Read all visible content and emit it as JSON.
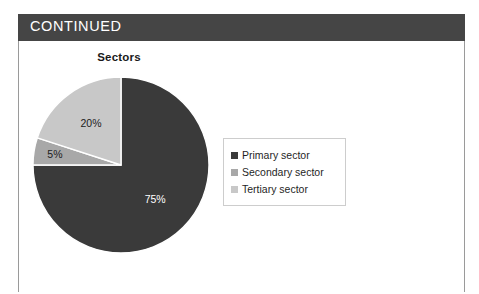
{
  "banner": {
    "label": "CONTINUED",
    "background_color": "#454545",
    "text_color": "#ffffff"
  },
  "page": {
    "background_color": "#ffffff",
    "frame_color": "#9a9a9a"
  },
  "legend": {
    "position": "right",
    "border_color": "#cdcdcd",
    "entries": [
      {
        "label": "Primary sector",
        "color": "#3a3a3a"
      },
      {
        "label": "Secondary sector",
        "color": "#a8a8a8"
      },
      {
        "label": "Tertiary sector",
        "color": "#c8c8c8"
      }
    ]
  },
  "chart_data": {
    "type": "pie",
    "title": "Sectors",
    "xlabel": "",
    "ylabel": "",
    "grid": false,
    "legend_position": "right",
    "start_angle_deg": 0,
    "direction": "clockwise",
    "categories": [
      "Primary sector",
      "Secondary sector",
      "Tertiary sector"
    ],
    "values": [
      75,
      5,
      20
    ],
    "unit": "%",
    "data_labels": [
      "75%",
      "5%",
      "20%"
    ],
    "colors": [
      "#3a3a3a",
      "#a8a8a8",
      "#c8c8c8"
    ],
    "slices": [
      {
        "name": "Primary sector",
        "value": 75,
        "label": "75%",
        "color": "#3a3a3a",
        "label_color": "#ffffff",
        "start_deg": 0,
        "end_deg": 270
      },
      {
        "name": "Secondary sector",
        "value": 5,
        "label": "5%",
        "color": "#a8a8a8",
        "label_color": "#1c1c1c",
        "start_deg": 270,
        "end_deg": 288
      },
      {
        "name": "Tertiary sector",
        "value": 20,
        "label": "20%",
        "color": "#c8c8c8",
        "label_color": "#1c1c1c",
        "start_deg": 288,
        "end_deg": 360
      }
    ]
  }
}
